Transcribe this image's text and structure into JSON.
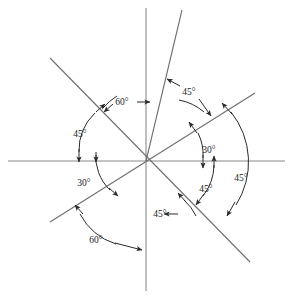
{
  "figure": {
    "center": {
      "x": 146,
      "y": 161
    },
    "background_color": "#ffffff",
    "axis_color": "#8a8a8a",
    "ray_color": "#6e6e6e",
    "annotation_color": "#2a2a2a",
    "degree_symbol": "°"
  },
  "axes": [
    {
      "name": "horizontal-axis",
      "x1": 8,
      "y1": 161,
      "x2": 285,
      "y2": 161
    },
    {
      "name": "vertical-axis",
      "x1": 146,
      "y1": 8,
      "x2": 146,
      "y2": 291
    }
  ],
  "rays": [
    {
      "name": "ray-75-upper-right",
      "x1": 182,
      "y1": 10,
      "x2": 146,
      "y2": 161,
      "angle_deg": 75
    },
    {
      "name": "ray-30-upper-right",
      "x1": 255,
      "y1": 93,
      "x2": 50,
      "y2": 222,
      "angle_deg": 30
    },
    {
      "name": "ray-135-upper-left",
      "x1": 50,
      "y1": 58,
      "x2": 250,
      "y2": 262,
      "angle_deg": 135
    }
  ],
  "labels": [
    {
      "name": "label-60-upper",
      "text": "60°",
      "x": 122,
      "y": 104
    },
    {
      "name": "label-45-upper-right",
      "text": "45°",
      "x": 188,
      "y": 94
    },
    {
      "name": "label-30-right",
      "text": "30°",
      "x": 209,
      "y": 150
    },
    {
      "name": "label-75-right",
      "text": "75°",
      "x": 241,
      "y": 178
    },
    {
      "name": "label-45-lower-right",
      "text": "45°",
      "x": 204,
      "y": 192
    },
    {
      "name": "label-45-left",
      "text": "45°",
      "x": 79,
      "y": 135
    },
    {
      "name": "label-30-left",
      "text": "30°",
      "x": 82,
      "y": 183
    },
    {
      "name": "label-45-bottom",
      "text": "45°",
      "x": 160,
      "y": 214
    },
    {
      "name": "label-60-bottom",
      "text": "60°",
      "x": 95,
      "y": 240
    }
  ],
  "caption": {
    "text": ""
  }
}
